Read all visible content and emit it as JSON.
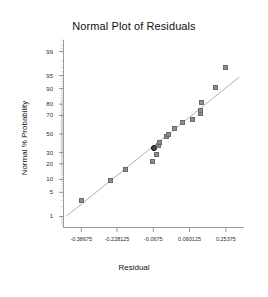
{
  "chart_data": {
    "type": "scatter",
    "title": "Normal Plot of Residuals",
    "xlabel": "Residual",
    "ylabel": "Normal % Probability",
    "grid": false,
    "legend": null,
    "xlim": [
      -0.4675,
      0.334
    ],
    "xticks": [
      -0.38675,
      -0.228125,
      -0.0675,
      0.093125,
      0.25375
    ],
    "xtick_labels": [
      "-0.38675",
      "-0.228125",
      "-0.0675",
      "0.093125",
      "0.25375"
    ],
    "yscale": "normal-probability",
    "ylim": [
      0.4,
      99.6
    ],
    "yticks": [
      99,
      95,
      90,
      80,
      70,
      50,
      30,
      20,
      10,
      5,
      1
    ],
    "ytick_labels": [
      "99",
      "95",
      "90",
      "80",
      "70",
      "50",
      "30",
      "20",
      "10",
      "5",
      "1"
    ],
    "series": [
      {
        "name": "Residuals",
        "marker": "square",
        "color": "#8e8e92",
        "points": [
          {
            "x": -0.384,
            "y": 3.1,
            "highlighted": false
          },
          {
            "x": -0.259,
            "y": 9.4,
            "highlighted": false
          },
          {
            "x": -0.192,
            "y": 15.6,
            "highlighted": false
          },
          {
            "x": -0.069,
            "y": 21.9,
            "highlighted": false
          },
          {
            "x": -0.052,
            "y": 28.1,
            "highlighted": false
          },
          {
            "x": -0.066,
            "y": 34.4,
            "highlighted": true
          },
          {
            "x": -0.043,
            "y": 37.5,
            "highlighted": false
          },
          {
            "x": -0.04,
            "y": 40.6,
            "highlighted": false
          },
          {
            "x": -0.008,
            "y": 46.9,
            "highlighted": false
          },
          {
            "x": -0.002,
            "y": 50.0,
            "highlighted": false
          },
          {
            "x": 0.026,
            "y": 56.2,
            "highlighted": false
          },
          {
            "x": 0.063,
            "y": 62.5,
            "highlighted": false
          },
          {
            "x": 0.108,
            "y": 65.6,
            "highlighted": false
          },
          {
            "x": 0.14,
            "y": 71.9,
            "highlighted": false
          },
          {
            "x": 0.141,
            "y": 75.0,
            "highlighted": false
          },
          {
            "x": 0.147,
            "y": 81.2,
            "highlighted": false
          },
          {
            "x": 0.207,
            "y": 90.6,
            "highlighted": false
          },
          {
            "x": 0.253,
            "y": 96.9,
            "highlighted": false
          }
        ]
      }
    ],
    "reference_line": {
      "name": "normal reference line",
      "color": "#9a9a9a",
      "x_start": -0.454,
      "y_start": 1.0,
      "x_end": 0.313,
      "y_end": 94.6
    }
  }
}
